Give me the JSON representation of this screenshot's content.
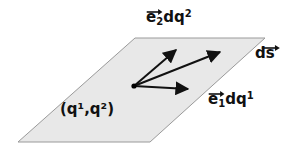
{
  "figure": {
    "background_color": "#ffffff",
    "surface": {
      "fill_color": "#e8e8e8",
      "stroke_color": "#8a8a8a",
      "vertices": [
        [
          135,
          38
        ],
        [
          265,
          38
        ],
        [
          150,
          142
        ],
        [
          18,
          142
        ]
      ]
    },
    "origin_point": {
      "x": 134,
      "y": 86,
      "color": "#000000"
    },
    "vectors": [
      {
        "name": "e2dq2",
        "from": [
          134,
          86
        ],
        "to": [
          178,
          48
        ],
        "color": "#000000"
      },
      {
        "name": "ds",
        "from": [
          134,
          86
        ],
        "to": [
          222,
          50
        ],
        "color": "#000000"
      },
      {
        "name": "e1dq1",
        "from": [
          134,
          86
        ],
        "to": [
          190,
          89
        ],
        "color": "#000000"
      }
    ]
  },
  "labels": {
    "e2dq2": {
      "base": "e",
      "subscript": "2",
      "rest": "dq",
      "superscript": "2"
    },
    "e1dq1": {
      "base": "e",
      "subscript": "1",
      "rest": "dq",
      "superscript": "1"
    },
    "ds": {
      "text": "ds"
    },
    "coordinate_point": {
      "text": "(q¹,q²)"
    }
  }
}
